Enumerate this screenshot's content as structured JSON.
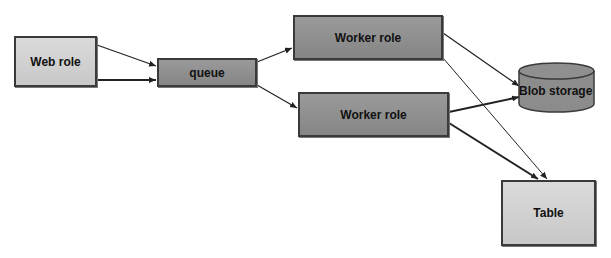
{
  "diagram": {
    "nodes": {
      "web_role": {
        "label": "Web role",
        "shape": "rectangle",
        "fill": "#cfcfcf"
      },
      "queue": {
        "label": "queue",
        "shape": "rectangle",
        "fill": "#8c8c8c"
      },
      "worker_role_1": {
        "label": "Worker role",
        "shape": "rectangle",
        "fill": "#8c8c8c"
      },
      "worker_role_2": {
        "label": "Worker role",
        "shape": "rectangle",
        "fill": "#8c8c8c"
      },
      "blob_storage": {
        "label": "Blob storage",
        "shape": "cylinder",
        "fill": "#8c8c8c"
      },
      "table": {
        "label": "Table",
        "shape": "rectangle",
        "fill": "#cfcfcf"
      }
    },
    "edges": [
      {
        "from": "web_role",
        "to": "queue"
      },
      {
        "from": "web_role",
        "to": "queue"
      },
      {
        "from": "queue",
        "to": "worker_role_1"
      },
      {
        "from": "queue",
        "to": "worker_role_2"
      },
      {
        "from": "worker_role_1",
        "to": "blob_storage"
      },
      {
        "from": "worker_role_1",
        "to": "table"
      },
      {
        "from": "worker_role_2",
        "to": "blob_storage"
      },
      {
        "from": "worker_role_2",
        "to": "table"
      }
    ]
  }
}
